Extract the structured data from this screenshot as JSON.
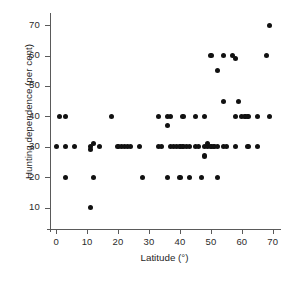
{
  "chart_data": {
    "type": "scatter",
    "title": "",
    "xlabel": "Latitude (°)",
    "ylabel": "Hunting dependence (per cent)",
    "xlim": [
      -2,
      72
    ],
    "ylim": [
      3,
      73
    ],
    "xticks": [
      0,
      10,
      20,
      30,
      40,
      50,
      60,
      70
    ],
    "yticks": [
      10,
      20,
      30,
      40,
      50,
      60,
      70
    ],
    "xticklabels": [
      "0",
      "10",
      "20",
      "30",
      "40",
      "50",
      "60",
      "70"
    ],
    "yticklabels": [
      "10",
      "20",
      "30",
      "40",
      "50",
      "60",
      "70"
    ],
    "grid": false,
    "legend": null,
    "marker": "filled-circle",
    "marker_color": "#111111",
    "points": [
      [
        1,
        40
      ],
      [
        3,
        40
      ],
      [
        0,
        30
      ],
      [
        3,
        30
      ],
      [
        6,
        30
      ],
      [
        3,
        20
      ],
      [
        11,
        10
      ],
      [
        11,
        30
      ],
      [
        11,
        29
      ],
      [
        12,
        20
      ],
      [
        12,
        31
      ],
      [
        14,
        30
      ],
      [
        18,
        40
      ],
      [
        20,
        30
      ],
      [
        21,
        30
      ],
      [
        22,
        30
      ],
      [
        23,
        30
      ],
      [
        24,
        30
      ],
      [
        27,
        30
      ],
      [
        28,
        20
      ],
      [
        33,
        40
      ],
      [
        33,
        30
      ],
      [
        34,
        30
      ],
      [
        36,
        40
      ],
      [
        36,
        37
      ],
      [
        36,
        20
      ],
      [
        37,
        40
      ],
      [
        37,
        30
      ],
      [
        38,
        30
      ],
      [
        39,
        30
      ],
      [
        40,
        30
      ],
      [
        40,
        20
      ],
      [
        41,
        40
      ],
      [
        41,
        30
      ],
      [
        42,
        30
      ],
      [
        43,
        30
      ],
      [
        43,
        20
      ],
      [
        45,
        40
      ],
      [
        45,
        30
      ],
      [
        46,
        30
      ],
      [
        47,
        20
      ],
      [
        48,
        40
      ],
      [
        48,
        30
      ],
      [
        48,
        27
      ],
      [
        49,
        30
      ],
      [
        49,
        31
      ],
      [
        50,
        60
      ],
      [
        50,
        30
      ],
      [
        51,
        30
      ],
      [
        52,
        55
      ],
      [
        52,
        20
      ],
      [
        52,
        30
      ],
      [
        54,
        60
      ],
      [
        54,
        45
      ],
      [
        54,
        30
      ],
      [
        55,
        30
      ],
      [
        57,
        60
      ],
      [
        58,
        59
      ],
      [
        58,
        40
      ],
      [
        58,
        30
      ],
      [
        59,
        45
      ],
      [
        60,
        40
      ],
      [
        61,
        40
      ],
      [
        62,
        40
      ],
      [
        62,
        30
      ],
      [
        65,
        40
      ],
      [
        65,
        30
      ],
      [
        68,
        60
      ],
      [
        69,
        70
      ],
      [
        69,
        40
      ]
    ]
  }
}
